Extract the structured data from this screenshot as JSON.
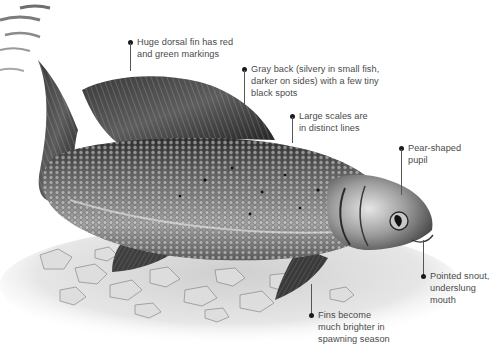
{
  "figure": {
    "colors": {
      "background": "#ffffff",
      "label_text": "#4a4a4a",
      "leader_line": "#555555",
      "fish_dark": "#2a2a2a",
      "fish_mid": "#7a7a7a",
      "fish_light": "#d9d9d9",
      "gravel": "#c9c9c9"
    }
  },
  "annotations": [
    {
      "id": "dorsal-fin",
      "lines": [
        "Huge dorsal fin has red",
        "and green markings"
      ]
    },
    {
      "id": "gray-back",
      "lines": [
        "Gray back (silvery in small fish,",
        "darker on sides) with a few tiny",
        "black spots"
      ]
    },
    {
      "id": "scales",
      "lines": [
        "Large scales are",
        "in distinct lines"
      ]
    },
    {
      "id": "pupil",
      "lines": [
        "Pear-shaped",
        "pupil"
      ]
    },
    {
      "id": "snout",
      "lines": [
        "Pointed snout,",
        "underslung",
        "mouth"
      ]
    },
    {
      "id": "fins",
      "lines": [
        "Fins become",
        "much brighter in",
        "spawning season"
      ]
    }
  ]
}
